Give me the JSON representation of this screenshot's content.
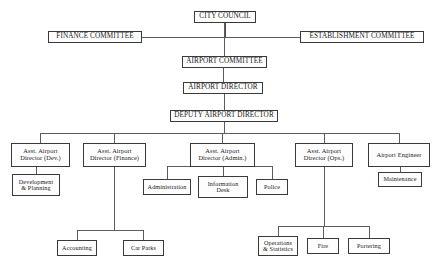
{
  "chart_data": {
    "type": "diagram",
    "orientation": "top-down-hierarchy",
    "nodes": [
      {
        "id": "city_council",
        "label": "CITY COUNCIL",
        "level": 0,
        "x": 194,
        "y": 11,
        "w": 62,
        "h": 12,
        "style": "t-caps"
      },
      {
        "id": "finance_committee",
        "label": "FINANCE COMMITTEE",
        "level": 1,
        "x": 48,
        "y": 31,
        "w": 94,
        "h": 12,
        "style": "t-caps"
      },
      {
        "id": "establishment_cmte",
        "label": "ESTABLISHMENT COMMITTEE",
        "level": 1,
        "x": 300,
        "y": 31,
        "w": 124,
        "h": 12,
        "style": "t-caps"
      },
      {
        "id": "airport_committee",
        "label": "AIRPORT COMMITTEE",
        "level": 2,
        "x": 182,
        "y": 56,
        "w": 85,
        "h": 12,
        "style": "t-caps"
      },
      {
        "id": "airport_director",
        "label": "AIRPORT DIRECTOR",
        "level": 3,
        "x": 183,
        "y": 82,
        "w": 80,
        "h": 12,
        "style": "t-caps"
      },
      {
        "id": "deputy_director",
        "label": "DEPUTY AIRPORT DIRECTOR",
        "level": 4,
        "x": 170,
        "y": 110,
        "w": 108,
        "h": 12,
        "style": "t-caps"
      },
      {
        "id": "aad_dev",
        "label": "Asst. Airport\nDirector (Dev.)",
        "level": 5,
        "x": 11,
        "y": 143,
        "w": 59,
        "h": 24,
        "style": "t-body"
      },
      {
        "id": "aad_finance",
        "label": "Asst. Airport\nDirector (Finance)",
        "level": 5,
        "x": 83,
        "y": 143,
        "w": 63,
        "h": 24,
        "style": "t-body"
      },
      {
        "id": "aad_admin",
        "label": "Asst. Airport\nDirector (Admin.)",
        "level": 5,
        "x": 190,
        "y": 143,
        "w": 65,
        "h": 24,
        "style": "t-body"
      },
      {
        "id": "aad_ops",
        "label": "Asst. Airport\nDirector (Ops.)",
        "level": 5,
        "x": 295,
        "y": 143,
        "w": 58,
        "h": 24,
        "style": "t-body"
      },
      {
        "id": "airport_engineer",
        "label": "Airport Engineer",
        "level": 5,
        "x": 368,
        "y": 143,
        "w": 62,
        "h": 24,
        "style": "t-body"
      },
      {
        "id": "development",
        "label": "Development\n& Planning",
        "level": 6,
        "x": 12,
        "y": 174,
        "w": 48,
        "h": 22,
        "style": "t-small"
      },
      {
        "id": "administration",
        "label": "Administration",
        "level": 6,
        "x": 143,
        "y": 179,
        "w": 48,
        "h": 16,
        "style": "t-small"
      },
      {
        "id": "information_desk",
        "label": "Information\nDesk",
        "level": 6,
        "x": 198,
        "y": 176,
        "w": 50,
        "h": 22,
        "style": "t-small"
      },
      {
        "id": "police",
        "label": "Police",
        "level": 6,
        "x": 256,
        "y": 179,
        "w": 32,
        "h": 16,
        "style": "t-small"
      },
      {
        "id": "maintenance",
        "label": "Maintenance",
        "level": 6,
        "x": 378,
        "y": 172,
        "w": 44,
        "h": 15,
        "style": "t-small"
      },
      {
        "id": "accounting",
        "label": "Accounting",
        "level": 7,
        "x": 57,
        "y": 240,
        "w": 40,
        "h": 16,
        "style": "t-small"
      },
      {
        "id": "car_parks",
        "label": "Car Parks",
        "level": 7,
        "x": 123,
        "y": 240,
        "w": 41,
        "h": 16,
        "style": "t-small"
      },
      {
        "id": "operations_stats",
        "label": "Operations\n& Statistics",
        "level": 7,
        "x": 258,
        "y": 236,
        "w": 40,
        "h": 20,
        "style": "t-small"
      },
      {
        "id": "fire",
        "label": "Fire",
        "level": 7,
        "x": 307,
        "y": 238,
        "w": 32,
        "h": 16,
        "style": "t-small"
      },
      {
        "id": "portering",
        "label": "Portering",
        "level": 7,
        "x": 348,
        "y": 238,
        "w": 42,
        "h": 16,
        "style": "t-small"
      }
    ],
    "edges": [
      {
        "from": "city_council",
        "to": "finance_committee",
        "kind": "lateral"
      },
      {
        "from": "city_council",
        "to": "establishment_cmte",
        "kind": "lateral"
      },
      {
        "from": "city_council",
        "to": "airport_committee",
        "kind": "vertical"
      },
      {
        "from": "airport_committee",
        "to": "airport_director",
        "kind": "vertical"
      },
      {
        "from": "airport_director",
        "to": "deputy_director",
        "kind": "vertical"
      },
      {
        "from": "deputy_director",
        "to": "aad_dev",
        "kind": "bus"
      },
      {
        "from": "deputy_director",
        "to": "aad_finance",
        "kind": "bus"
      },
      {
        "from": "deputy_director",
        "to": "aad_admin",
        "kind": "bus"
      },
      {
        "from": "deputy_director",
        "to": "aad_ops",
        "kind": "bus"
      },
      {
        "from": "deputy_director",
        "to": "airport_engineer",
        "kind": "bus"
      },
      {
        "from": "aad_dev",
        "to": "development",
        "kind": "vertical"
      },
      {
        "from": "aad_finance",
        "to": "accounting",
        "kind": "bus"
      },
      {
        "from": "aad_finance",
        "to": "car_parks",
        "kind": "bus"
      },
      {
        "from": "aad_admin",
        "to": "administration",
        "kind": "bus"
      },
      {
        "from": "aad_admin",
        "to": "information_desk",
        "kind": "bus"
      },
      {
        "from": "aad_admin",
        "to": "police",
        "kind": "bus"
      },
      {
        "from": "aad_ops",
        "to": "operations_stats",
        "kind": "bus"
      },
      {
        "from": "aad_ops",
        "to": "fire",
        "kind": "bus"
      },
      {
        "from": "aad_ops",
        "to": "portering",
        "kind": "bus"
      },
      {
        "from": "airport_engineer",
        "to": "maintenance",
        "kind": "vertical"
      }
    ],
    "line_color": "#4a4a4a",
    "box_border_color": "#3a3a3a",
    "box_fill_color": "#fdfdfd",
    "text_color": "#1a1a1a",
    "background_color": "#ffffff"
  }
}
